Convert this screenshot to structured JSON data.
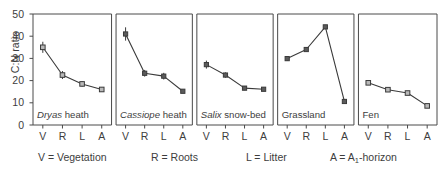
{
  "chart_data": {
    "type": "line",
    "title": "",
    "xlabel": "",
    "ylabel": "C:N ratio",
    "ylim": [
      0,
      50
    ],
    "yticks": [
      0,
      10,
      20,
      30,
      40,
      50
    ],
    "grid": false,
    "legend_position": "below-axis",
    "categories": [
      "V",
      "R",
      "L",
      "A"
    ],
    "category_definitions": [
      {
        "key": "V",
        "text": "V = Vegetation"
      },
      {
        "key": "R",
        "text": "R = Roots"
      },
      {
        "key": "L",
        "text": "L = Litter"
      },
      {
        "key": "A",
        "text": "A = A1-horizon",
        "prefix": "A = A",
        "sub": "1",
        "suffix": "-horizon"
      }
    ],
    "panels": [
      {
        "name": "Dryas heath",
        "genus": "Dryas",
        "rest": " heath",
        "marker": "open-square",
        "values": [
          35.0,
          22.5,
          18.5,
          16.0
        ],
        "errors": [
          2.5,
          1.8,
          1.2,
          0.8
        ]
      },
      {
        "name": "Cassiope heath",
        "genus": "Cassiope",
        "rest": " heath",
        "marker": "filled-square",
        "values": [
          41.0,
          23.3,
          22.0,
          15.2
        ],
        "errors": [
          3.0,
          1.5,
          1.5,
          0.8
        ]
      },
      {
        "name": "Salix snow-bed",
        "genus": "Salix",
        "rest": " snow-bed",
        "marker": "filled-square",
        "values": [
          27.2,
          22.5,
          16.6,
          16.1
        ],
        "errors": [
          1.8,
          1.2,
          0.9,
          0.8
        ]
      },
      {
        "name": "Grassland",
        "genus": "",
        "rest": "Grassland",
        "marker": "filled-square",
        "values": [
          29.9,
          34.0,
          44.2,
          10.6
        ],
        "errors": [
          1.0,
          0.9,
          0.9,
          0.8
        ]
      },
      {
        "name": "Fen",
        "genus": "",
        "rest": "Fen",
        "marker": "open-square",
        "values": [
          19.0,
          15.9,
          14.4,
          8.6
        ],
        "errors": [
          0.9,
          0.8,
          0.8,
          0.7
        ]
      }
    ]
  },
  "axis": {
    "tick_labels": [
      "50",
      "40",
      "30",
      "20",
      "10",
      "0"
    ],
    "y_axis_title": "C:N ratio"
  },
  "colors": {
    "axis": "#4a4a4a",
    "line": "#3a3a3a",
    "marker_fill_open": "#b9b9b9",
    "marker_fill_solid": "#5b5b5b",
    "marker_edge": "#3a3a3a",
    "text": "#3d3d3d",
    "background": "#ffffff"
  }
}
